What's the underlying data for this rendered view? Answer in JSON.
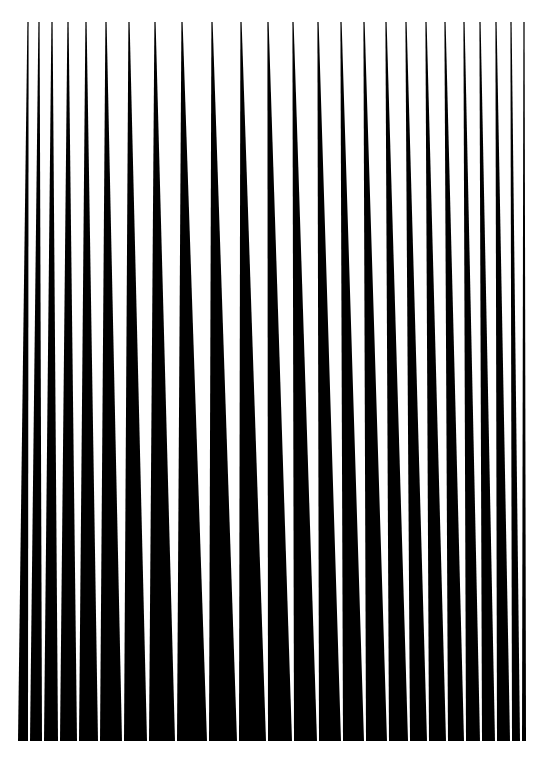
{
  "canvas": {
    "width": 543,
    "height": 759,
    "background": "#ffffff",
    "ink": "#000000"
  },
  "artwork": {
    "description": "Abstract op-art of black vertical wedges tapering to points at the top and widening toward the bottom, separated by thin white slits",
    "top_y": 22,
    "bottom_y": 741,
    "wedges": [
      {
        "top_x": 28,
        "bottom_left": 18,
        "bottom_right": 28
      },
      {
        "top_x": 39,
        "bottom_left": 30,
        "bottom_right": 42
      },
      {
        "top_x": 52,
        "bottom_left": 44,
        "bottom_right": 58
      },
      {
        "top_x": 68,
        "bottom_left": 60,
        "bottom_right": 77
      },
      {
        "top_x": 86,
        "bottom_left": 79,
        "bottom_right": 98
      },
      {
        "top_x": 106,
        "bottom_left": 100,
        "bottom_right": 122
      },
      {
        "top_x": 129,
        "bottom_left": 124,
        "bottom_right": 147
      },
      {
        "top_x": 155,
        "bottom_left": 149,
        "bottom_right": 175
      },
      {
        "top_x": 182,
        "bottom_left": 177,
        "bottom_right": 207
      },
      {
        "top_x": 212,
        "bottom_left": 209,
        "bottom_right": 237
      },
      {
        "top_x": 241,
        "bottom_left": 239,
        "bottom_right": 266
      },
      {
        "top_x": 268,
        "bottom_left": 268,
        "bottom_right": 292
      },
      {
        "top_x": 293,
        "bottom_left": 294,
        "bottom_right": 317
      },
      {
        "top_x": 318,
        "bottom_left": 319,
        "bottom_right": 341
      },
      {
        "top_x": 341,
        "bottom_left": 343,
        "bottom_right": 364
      },
      {
        "top_x": 364,
        "bottom_left": 366,
        "bottom_right": 387
      },
      {
        "top_x": 386,
        "bottom_left": 389,
        "bottom_right": 408
      },
      {
        "top_x": 406,
        "bottom_left": 410,
        "bottom_right": 427
      },
      {
        "top_x": 426,
        "bottom_left": 429,
        "bottom_right": 446
      },
      {
        "top_x": 445,
        "bottom_left": 448,
        "bottom_right": 464
      },
      {
        "top_x": 464,
        "bottom_left": 466,
        "bottom_right": 480
      },
      {
        "top_x": 480,
        "bottom_left": 482,
        "bottom_right": 495
      },
      {
        "top_x": 496,
        "bottom_left": 497,
        "bottom_right": 510
      },
      {
        "top_x": 511,
        "bottom_left": 512,
        "bottom_right": 520
      },
      {
        "top_x": 524,
        "bottom_left": 522,
        "bottom_right": 526
      }
    ]
  }
}
